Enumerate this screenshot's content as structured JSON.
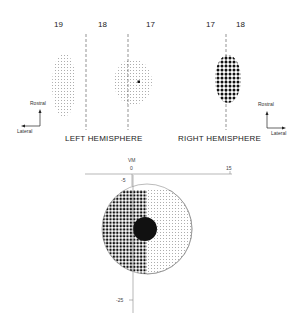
{
  "left_hemisphere": {
    "label": "LEFT HEMISPHERE",
    "area_labels": [
      "19",
      "18",
      "17"
    ],
    "orientation": {
      "up": "Rostral",
      "side": "Lateral"
    }
  },
  "right_hemisphere": {
    "label": "RIGHT HEMISPHERE",
    "area_labels": [
      "17",
      "18"
    ],
    "orientation": {
      "up": "Rostral",
      "side": "Lateral"
    }
  },
  "visual_field": {
    "vm_label": "VM",
    "x_ticks": [
      "0",
      "15"
    ],
    "y_ticks": [
      "-5",
      "-25"
    ]
  }
}
